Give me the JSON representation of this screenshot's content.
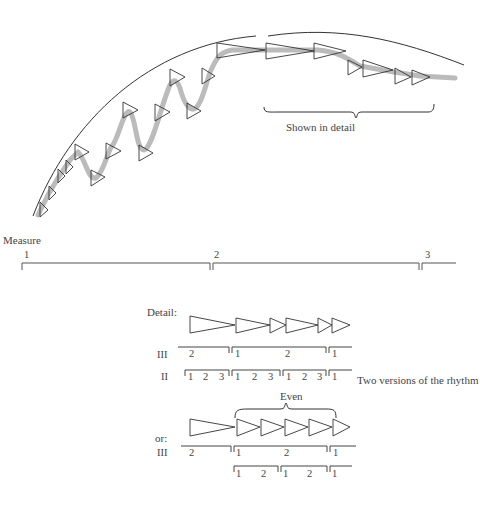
{
  "top_figure": {
    "annotation": "Shown in detail"
  },
  "measure_line": {
    "label": "Measure",
    "numbers": [
      "1",
      "2",
      "3"
    ]
  },
  "detail": {
    "label": "Detail:",
    "row_labels": {
      "iii": "III",
      "ii": "II"
    },
    "iii_numbers": [
      "2",
      "1",
      "2",
      "1"
    ],
    "ii_numbers": [
      "1",
      "2",
      "3",
      "1",
      "2",
      "3",
      "1",
      "2",
      "3",
      "1"
    ],
    "side_caption": "Two versions of the rhythm"
  },
  "alternative": {
    "label": "or:",
    "brace_label": "Even",
    "row_label_iii": "III",
    "iii_numbers": [
      "2",
      "1",
      "2",
      "1"
    ],
    "lower_numbers": [
      "1",
      "2",
      "1",
      "2",
      "1"
    ]
  }
}
